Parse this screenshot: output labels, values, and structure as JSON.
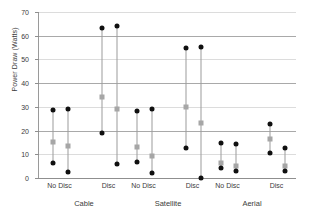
{
  "chart_data": {
    "type": "scatter",
    "title": "",
    "xlabel": "",
    "ylabel": "Power Draw (Watts)",
    "ylim": [
      0,
      70
    ],
    "ytick_labels": [
      "0",
      "10",
      "20",
      "30",
      "40",
      "50",
      "60",
      "70"
    ],
    "ytick_values": [
      0,
      10,
      20,
      30,
      40,
      50,
      60,
      70
    ],
    "grid": true,
    "legend": "none",
    "grid_major_values": [
      0,
      20,
      40,
      60
    ],
    "grid_minor_values": [
      10,
      30,
      50,
      70
    ],
    "colors": {
      "max_min_marker": "#101010",
      "mean_marker": "#a6a6a6",
      "range_line": "#9b9b9b",
      "grid_major": "#a9a9a9",
      "grid_minor": "#dcdcdc",
      "axis": "#8f8f8f",
      "text": "#3b3b3b",
      "background": "#ffffff"
    },
    "groups": [
      {
        "label": "Cable",
        "subgroups": [
          {
            "label": "No Disc",
            "series": [
              {
                "max": 28.7,
                "mean": 15.0,
                "min": 6.4
              },
              {
                "max": 29.2,
                "mean": 13.4,
                "min": 2.7
              }
            ]
          },
          {
            "label": "Disc",
            "series": [
              {
                "max": 63.2,
                "mean": 34.1,
                "min": 18.8
              },
              {
                "max": 64.0,
                "mean": 29.0,
                "min": 5.8
              }
            ]
          }
        ]
      },
      {
        "label": "Satellite",
        "subgroups": [
          {
            "label": "No Disc",
            "series": [
              {
                "max": 28.4,
                "mean": 13.0,
                "min": 6.9
              },
              {
                "max": 29.2,
                "mean": 9.3,
                "min": 2.1
              }
            ]
          },
          {
            "label": "Disc",
            "series": [
              {
                "max": 54.7,
                "mean": 29.8,
                "min": 12.5
              },
              {
                "max": 55.1,
                "mean": 23.0,
                "min": 0.2
              }
            ]
          }
        ]
      },
      {
        "label": "Aerial",
        "subgroups": [
          {
            "label": "No Disc",
            "series": [
              {
                "max": 14.6,
                "mean": 6.3,
                "min": 4.3
              },
              {
                "max": 14.3,
                "mean": 5.1,
                "min": 2.8
              }
            ]
          },
          {
            "label": "Disc",
            "series": [
              {
                "max": 22.9,
                "mean": 16.6,
                "min": 10.6
              },
              {
                "max": 12.8,
                "mean": 4.9,
                "min": 3.1
              }
            ]
          }
        ]
      }
    ]
  }
}
